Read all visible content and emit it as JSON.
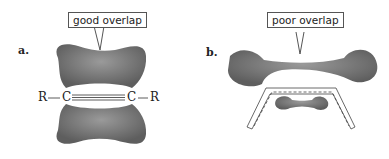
{
  "panels": [
    {
      "label": "a.",
      "callout": "good overlap",
      "structure": {
        "left_group": "R",
        "left_atom": "C",
        "right_atom": "C",
        "right_group": "R",
        "bond": "triple"
      }
    },
    {
      "label": "b.",
      "callout": "poor overlap"
    }
  ],
  "colors": {
    "lobe": "#8a8a8a",
    "lobe_dark": "#5a5a5a",
    "outline": "#444444"
  }
}
